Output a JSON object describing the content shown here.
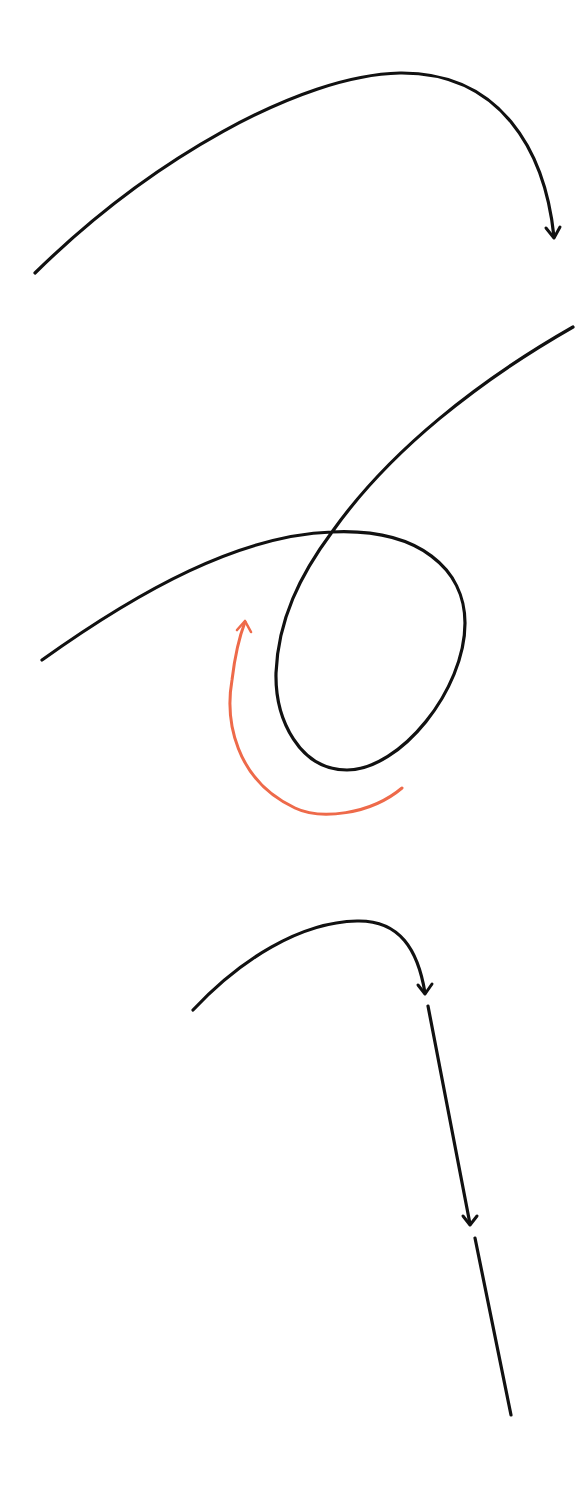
{
  "diagram": {
    "background": "#ffffff",
    "colors": {
      "path": "#111111",
      "accent": "#ee6a4a"
    },
    "panels": [
      {
        "id": "arc-arrow",
        "description": "arcing path ending in downward arrowhead"
      },
      {
        "id": "loop",
        "description": "path forming a loop that crosses itself, with orange curved arrow indicating counter-clockwise direction"
      },
      {
        "id": "arc-segments",
        "description": "short arc with arrowhead followed by dashed straight segments with arrowheads"
      }
    ]
  }
}
